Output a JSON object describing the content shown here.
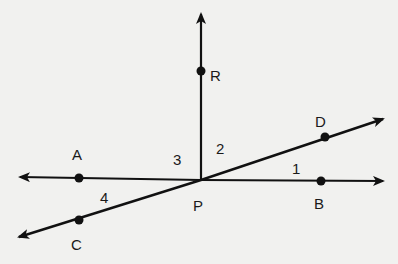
{
  "diagram": {
    "points": {
      "P": {
        "label": "P",
        "x": 201,
        "y": 180
      },
      "R": {
        "label": "R",
        "x": 201,
        "y": 71
      },
      "A": {
        "label": "A",
        "x": 79,
        "y": 178
      },
      "B": {
        "label": "B",
        "x": 321,
        "y": 181
      },
      "C": {
        "label": "C",
        "x": 79,
        "y": 220
      },
      "D": {
        "label": "D",
        "x": 325,
        "y": 137
      }
    },
    "angles": [
      {
        "label": "1",
        "between": "PB-PD"
      },
      {
        "label": "2",
        "between": "PD-PR"
      },
      {
        "label": "3",
        "between": "PR-PA"
      },
      {
        "label": "4",
        "between": "PA-PC"
      }
    ],
    "colors": {
      "line": "#111111",
      "background": "#f1f1ef"
    }
  }
}
